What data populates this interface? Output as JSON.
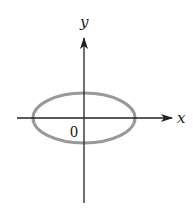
{
  "diagram": {
    "type": "coordinate-plane-ellipse",
    "labels": {
      "x_axis": "x",
      "y_axis": "y",
      "origin": "0"
    },
    "colors": {
      "axes": "#222222",
      "ellipse": "#999999",
      "background": "#ffffff"
    },
    "geometry": {
      "origin": [
        84,
        118
      ],
      "ellipse": {
        "cx": 84,
        "cy": 118,
        "rx": 51,
        "ry": 25
      },
      "x_axis": {
        "x1": 17,
        "x2": 172,
        "y": 118
      },
      "y_axis": {
        "x": 84,
        "y1": 203,
        "y2": 38
      }
    }
  }
}
